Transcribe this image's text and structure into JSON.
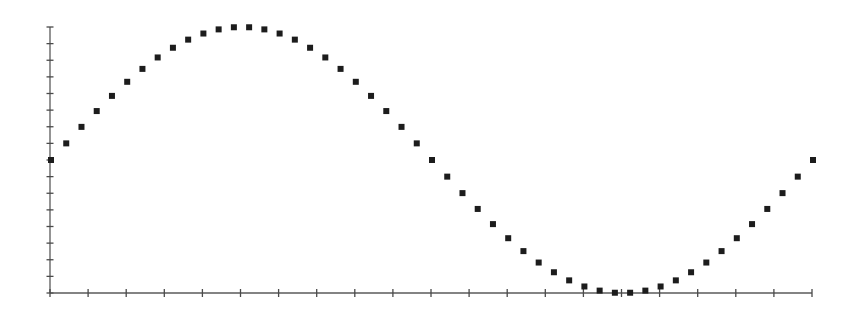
{
  "chart_data": {
    "type": "scatter",
    "title": "",
    "xlabel": "",
    "ylabel": "",
    "grid": false,
    "legend": null,
    "marker": "square",
    "series": [
      {
        "name": "sine",
        "x": [
          0,
          1,
          2,
          3,
          4,
          5,
          6,
          7,
          8,
          9,
          10,
          11,
          12,
          13,
          14,
          15,
          16,
          17,
          18,
          19,
          20,
          21,
          22,
          23,
          24,
          25,
          26,
          27,
          28,
          29,
          30,
          31,
          32,
          33,
          34,
          35,
          36,
          37,
          38,
          39,
          40,
          41,
          42,
          43,
          44,
          45,
          46,
          47,
          48,
          49,
          50
        ],
        "values": [
          0,
          0.125,
          0.249,
          0.368,
          0.482,
          0.588,
          0.685,
          0.771,
          0.844,
          0.905,
          0.951,
          0.982,
          0.998,
          0.998,
          0.982,
          0.951,
          0.905,
          0.844,
          0.771,
          0.685,
          0.588,
          0.482,
          0.368,
          0.249,
          0.125,
          0,
          -0.125,
          -0.249,
          -0.368,
          -0.482,
          -0.588,
          -0.685,
          -0.771,
          -0.844,
          -0.905,
          -0.951,
          -0.982,
          -0.998,
          -0.998,
          -0.982,
          -0.951,
          -0.905,
          -0.844,
          -0.771,
          -0.685,
          -0.588,
          -0.482,
          -0.368,
          -0.249,
          -0.125,
          0
        ]
      }
    ],
    "xlim": [
      0,
      50
    ],
    "ylim": [
      -1,
      1
    ],
    "x_tick_count": 21,
    "y_tick_count": 17,
    "x_tick_labels": [],
    "y_tick_labels": []
  },
  "style": {
    "point_color": "#1c1c1c",
    "axis_color": "#5a5a5a",
    "background": "#ffffff"
  },
  "layout": {
    "plot_left": 50,
    "plot_right": 812,
    "plot_top": 27,
    "plot_bottom": 293,
    "point_size": 6
  }
}
